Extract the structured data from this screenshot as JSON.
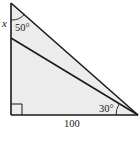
{
  "diagram": {
    "type": "geometry-triangle",
    "labels": {
      "side_label": "x",
      "top_angle": "50°",
      "bottom_right_angle": "30°",
      "base_length": "100"
    },
    "colors": {
      "fill": "#ececec",
      "stroke": "#1a1a1a"
    },
    "points": {
      "top": [
        11,
        3
      ],
      "bottom_left": [
        11,
        115
      ],
      "bottom_right": [
        137,
        115
      ],
      "inner_left": [
        11,
        38
      ]
    }
  }
}
